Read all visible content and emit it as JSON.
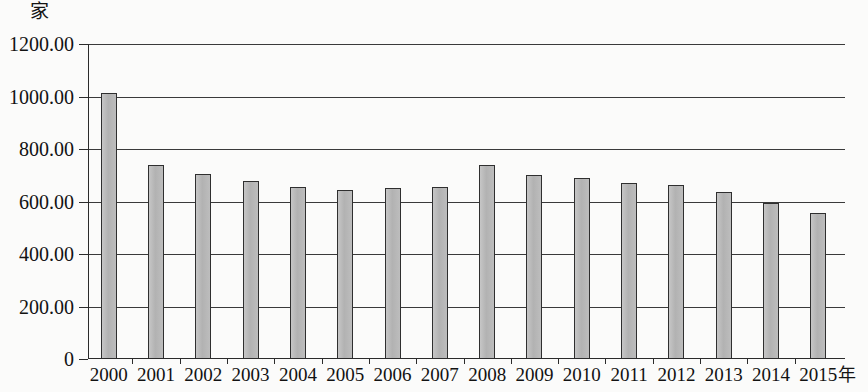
{
  "chart_data": {
    "type": "bar",
    "title": "",
    "subtitle": "",
    "xlabel": "年",
    "ylabel": "家",
    "categories": [
      "2000",
      "2001",
      "2002",
      "2003",
      "2004",
      "2005",
      "2006",
      "2007",
      "2008",
      "2009",
      "2010",
      "2011",
      "2012",
      "2013",
      "2014",
      "2015"
    ],
    "values": [
      1015,
      740,
      706,
      678,
      655,
      645,
      652,
      656,
      740,
      701,
      688,
      669,
      662,
      636,
      595,
      558
    ],
    "ylim": [
      0,
      1200
    ],
    "ytick_labels": [
      "1200.00",
      "1000.00",
      "800.00",
      "600.00",
      "400.00",
      "200.00",
      "0"
    ],
    "ytick_values": [
      1200,
      1000,
      800,
      600,
      400,
      200,
      0
    ],
    "grid": true,
    "legend": null,
    "legend_position": "none",
    "series": [
      {
        "name": "家",
        "values": [
          1015,
          740,
          706,
          678,
          655,
          645,
          652,
          656,
          740,
          701,
          688,
          669,
          662,
          636,
          595,
          558
        ]
      }
    ],
    "bar_fill_color": "#b9b9b9",
    "bar_edge_color": "#2f2f2f",
    "grid_color": "#3a3a3a",
    "axis_color": "#2b2b2b",
    "background_color": "#fbfbfa"
  },
  "labels": {
    "y_unit": "家",
    "x_unit": "年"
  }
}
